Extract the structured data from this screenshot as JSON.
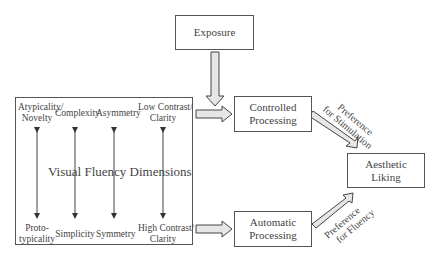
{
  "diagram": {
    "nodes": {
      "exposure": "Exposure",
      "controlled": [
        "Controlled",
        "Processing"
      ],
      "automatic": [
        "Automatic",
        "Processing"
      ],
      "aesthetic": [
        "Aesthetic",
        "Liking"
      ]
    },
    "dimensions_title": "Visual Fluency Dimensions",
    "dimensions": [
      {
        "top": [
          "Atypicality/",
          "Novelty"
        ],
        "bottom": [
          "Proto-",
          "typicality"
        ]
      },
      {
        "top": [
          "Complexity"
        ],
        "bottom": [
          "Simplicity"
        ]
      },
      {
        "top": [
          "Asymmetry"
        ],
        "bottom": [
          "Symmetry"
        ]
      },
      {
        "top": [
          "Low Contrast/",
          "Clarity"
        ],
        "bottom": [
          "High Contrast/",
          "Clarity"
        ]
      }
    ],
    "edge_labels": {
      "stimulation": [
        "Preference",
        "for Stimulation"
      ],
      "fluency": [
        "Preference",
        "for Fluency"
      ]
    }
  }
}
